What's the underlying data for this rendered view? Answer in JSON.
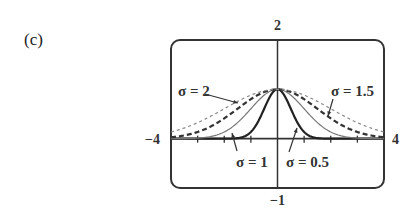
{
  "panel_label": "(c)",
  "chart_data": {
    "type": "line",
    "title": "",
    "function": "y = exp(-x^2 / (2*sigma^2))",
    "xlim": [
      -4,
      4
    ],
    "ylim": [
      -1,
      2
    ],
    "xlabel": "",
    "ylabel": "",
    "grid": false,
    "x_tick_step": 1,
    "tick_labels": {
      "xmin": "−4",
      "xmax": "4",
      "ymax": "2",
      "ymin": "−1"
    },
    "series": [
      {
        "name": "σ = 0.5",
        "sigma": 0.5,
        "style": "solid-thick",
        "color": "#222222",
        "x": [
          -4,
          -3,
          -2,
          -1.5,
          -1,
          -0.5,
          0,
          0.5,
          1,
          1.5,
          2,
          3,
          4
        ],
        "values": [
          0,
          0,
          0,
          0.011,
          0.135,
          0.607,
          1,
          0.607,
          0.135,
          0.011,
          0,
          0,
          0
        ]
      },
      {
        "name": "σ = 1",
        "sigma": 1,
        "style": "solid-thin",
        "color": "#777777",
        "x": [
          -4,
          -3,
          -2,
          -1,
          0,
          1,
          2,
          3,
          4
        ],
        "values": [
          0.0003,
          0.011,
          0.135,
          0.607,
          1,
          0.607,
          0.135,
          0.011,
          0.0003
        ]
      },
      {
        "name": "σ = 1.5",
        "sigma": 1.5,
        "style": "dashed-thick",
        "color": "#333333",
        "x": [
          -4,
          -3,
          -2,
          -1,
          0,
          1,
          2,
          3,
          4
        ],
        "values": [
          0.029,
          0.135,
          0.411,
          0.801,
          1,
          0.801,
          0.411,
          0.135,
          0.029
        ]
      },
      {
        "name": "σ = 2",
        "sigma": 2,
        "style": "dotted-thin",
        "color": "#888888",
        "x": [
          -4,
          -3,
          -2,
          -1,
          0,
          1,
          2,
          3,
          4
        ],
        "values": [
          0.135,
          0.325,
          0.607,
          0.882,
          1,
          0.882,
          0.607,
          0.325,
          0.135
        ]
      }
    ],
    "annotations": [
      {
        "text": "σ = 2",
        "target_series": "σ = 2"
      },
      {
        "text": "σ = 1.5",
        "target_series": "σ = 1.5"
      },
      {
        "text": "σ = 1",
        "target_series": "σ = 1"
      },
      {
        "text": "σ = 0.5",
        "target_series": "σ = 0.5"
      }
    ]
  }
}
